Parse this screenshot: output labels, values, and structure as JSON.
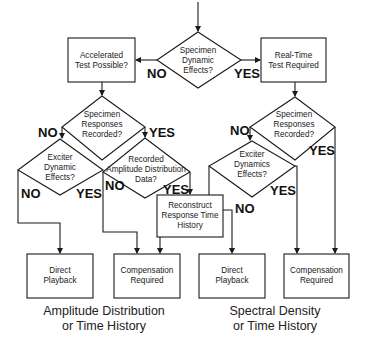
{
  "nodes": {
    "specimen_dynamic": {
      "type": "decision",
      "lines": [
        "Specimen",
        "Dynamic",
        "Effects?"
      ]
    },
    "accelerated": {
      "type": "process",
      "lines": [
        "Accelerated",
        "Test Possible?"
      ]
    },
    "realtime": {
      "type": "process",
      "lines": [
        "Real-Time",
        "Test Required"
      ]
    },
    "left_responses": {
      "type": "decision",
      "lines": [
        "Specimen",
        "Responses",
        "Recorded?"
      ]
    },
    "left_exciter": {
      "type": "decision",
      "lines": [
        "Exciter",
        "Dynamic",
        "Effects?"
      ]
    },
    "amplitude_data": {
      "type": "decision",
      "lines": [
        "Recorded",
        "Amplitude Distribution",
        "Data?"
      ]
    },
    "reconstruct": {
      "type": "process",
      "lines": [
        "Reconstruct",
        "Response Time",
        "History"
      ]
    },
    "right_responses": {
      "type": "decision",
      "lines": [
        "Specimen",
        "Responses",
        "Recorded?"
      ]
    },
    "right_exciter": {
      "type": "decision",
      "lines": [
        "Exciter",
        "Dynamics",
        "Effects?"
      ]
    },
    "left_playback": {
      "type": "terminal",
      "lines": [
        "Direct",
        "Playback"
      ]
    },
    "left_compensation": {
      "type": "terminal",
      "lines": [
        "Compensation",
        "Required"
      ]
    },
    "right_playback": {
      "type": "terminal",
      "lines": [
        "Direct",
        "Playback"
      ]
    },
    "right_compensation": {
      "type": "terminal",
      "lines": [
        "Compensation",
        "Required"
      ]
    }
  },
  "edge_labels": {
    "top_no": "NO",
    "top_yes": "YES",
    "left_resp_no": "NO",
    "left_resp_yes": "YES",
    "left_exciter_no": "NO",
    "left_exciter_yes": "YES",
    "amplitude_no": "NO",
    "amplitude_yes": "YES",
    "right_resp_no": "NO",
    "right_resp_yes": "YES",
    "right_exciter_no": "NO",
    "right_exciter_yes": "YES"
  },
  "captions": {
    "left": [
      "Amplitude Distribution",
      "or Time History"
    ],
    "right": [
      "Spectral Density",
      "or Time History"
    ]
  },
  "colors": {
    "stroke": "#1a1a1a",
    "background": "#ffffff"
  }
}
